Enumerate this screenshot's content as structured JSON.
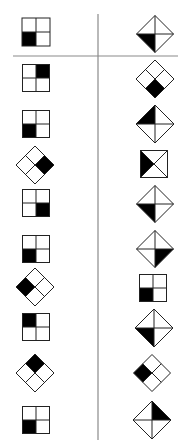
{
  "colors": {
    "stroke": "#222222",
    "fill": "#000000",
    "divider": "#8a8a8a",
    "background": "#ffffff"
  },
  "dividers": {
    "horizontal": {
      "x1": 13,
      "x2": 178,
      "y": 56
    },
    "vertical": {
      "x": 98,
      "y1": 14,
      "y2": 440
    }
  },
  "header": {
    "left": {
      "shape": "square-grid",
      "filled": "bottom-left",
      "cx": 36,
      "cy": 32,
      "size": 28
    },
    "right": {
      "shape": "triangle-diamond",
      "filled": "lower-left",
      "cx": 155,
      "cy": 34,
      "size": 37
    }
  },
  "rows": [
    {
      "left": {
        "shape": "square-grid",
        "filled": "top-right",
        "cx": 36,
        "cy": 78,
        "size": 27
      },
      "right": {
        "shape": "rotated-grid",
        "filled": "bottom",
        "cx": 155,
        "cy": 79,
        "size": 38
      }
    },
    {
      "left": {
        "shape": "square-grid",
        "filled": "bottom-left",
        "cx": 36,
        "cy": 124,
        "size": 27
      },
      "right": {
        "shape": "triangle-diamond",
        "filled": "upper-left",
        "cx": 155,
        "cy": 124,
        "size": 38
      }
    },
    {
      "left": {
        "shape": "rotated-grid",
        "filled": "right",
        "cx": 35,
        "cy": 165,
        "size": 38
      },
      "right": {
        "shape": "x-square",
        "filled": "left",
        "cx": 154,
        "cy": 164,
        "size": 27
      }
    },
    {
      "left": {
        "shape": "square-grid",
        "filled": "bottom-right",
        "cx": 36,
        "cy": 203,
        "size": 27
      },
      "right": {
        "shape": "triangle-diamond",
        "filled": "lower-left",
        "cx": 155,
        "cy": 204,
        "size": 37
      }
    },
    {
      "left": {
        "shape": "square-grid",
        "filled": "bottom-left",
        "cx": 36,
        "cy": 249,
        "size": 27
      },
      "right": {
        "shape": "triangle-diamond",
        "filled": "lower-right",
        "cx": 155,
        "cy": 249,
        "size": 37
      }
    },
    {
      "left": {
        "shape": "rotated-grid",
        "filled": "left",
        "cx": 35,
        "cy": 287,
        "size": 38
      },
      "right": {
        "shape": "square-grid",
        "filled": "bottom-left",
        "cx": 153,
        "cy": 288,
        "size": 27
      }
    },
    {
      "left": {
        "shape": "square-grid",
        "filled": "top-left",
        "cx": 36,
        "cy": 327,
        "size": 27
      },
      "right": {
        "shape": "triangle-diamond",
        "filled": "lower-left",
        "cx": 154,
        "cy": 328,
        "size": 38
      }
    },
    {
      "left": {
        "shape": "rotated-grid",
        "filled": "top",
        "cx": 35,
        "cy": 373,
        "size": 38
      },
      "right": {
        "shape": "rotated-grid",
        "filled": "left",
        "cx": 152,
        "cy": 373,
        "size": 37
      }
    },
    {
      "left": {
        "shape": "square-grid",
        "filled": "bottom-left",
        "cx": 36,
        "cy": 420,
        "size": 27
      },
      "right": {
        "shape": "triangle-diamond",
        "filled": "upper-right",
        "cx": 152,
        "cy": 420,
        "size": 38
      }
    }
  ]
}
